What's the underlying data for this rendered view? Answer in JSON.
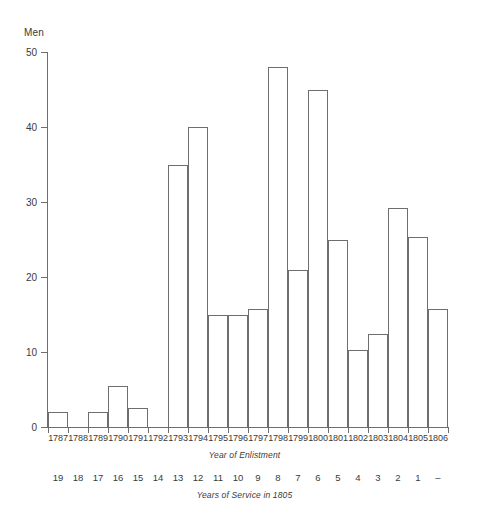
{
  "chart_data": {
    "type": "bar",
    "title": "",
    "ylabel": "Men",
    "xlabel": "Year of Enlistment",
    "xlabel_secondary": "Years of Service in 1805",
    "ylim": [
      0,
      50
    ],
    "yticks": [
      0,
      10,
      20,
      30,
      40,
      50
    ],
    "ytick_labels": [
      "0",
      "10",
      "20",
      "30",
      "40",
      "50"
    ],
    "grid": false,
    "legend": null,
    "categories": [
      "1787",
      "1788",
      "1789",
      "1790",
      "1791",
      "1792",
      "1793",
      "1794",
      "1795",
      "1796",
      "1797",
      "1798",
      "1799",
      "1800",
      "1801",
      "1802",
      "1803",
      "1804",
      "1805",
      "1806"
    ],
    "categories_secondary": [
      "19",
      "18",
      "17",
      "16",
      "15",
      "14",
      "13",
      "12",
      "11",
      "10",
      "9",
      "8",
      "7",
      "6",
      "5",
      "4",
      "3",
      "2",
      "1",
      "–"
    ],
    "values": [
      2,
      0,
      2,
      5.5,
      2.5,
      0,
      35,
      40,
      15,
      15,
      15.8,
      48,
      21,
      45,
      25,
      10.3,
      12.4,
      29.2,
      25.3,
      15.8
    ],
    "bar_edge_color": "#6e6e6e",
    "bar_fill_color": "#ffffff",
    "axis_color": "#6e6e6e",
    "background_color": "#ffffff"
  }
}
